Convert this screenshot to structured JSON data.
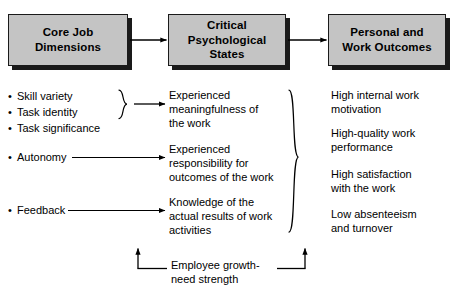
{
  "diagram": {
    "boxes": [
      {
        "id": "core-job-dimensions",
        "line1": "Core Job",
        "line2": "Dimensions"
      },
      {
        "id": "critical-psychological-states",
        "line1": "Critical",
        "line2": "Psychological",
        "line3": "States"
      },
      {
        "id": "personal-and-work-outcomes",
        "line1": "Personal and",
        "line2": "Work Outcomes"
      }
    ],
    "core_job_dimensions": {
      "group1": [
        "Skill variety",
        "Task identity",
        "Task significance"
      ],
      "group2": [
        "Autonomy"
      ],
      "group3": [
        "Feedback"
      ]
    },
    "critical_psychological_states": [
      "Experienced\nmeaningfulness of\nthe work",
      "Experienced\nresponsibility for\noutcomes of the work",
      "Knowledge of the\nactual results of work\nactivities"
    ],
    "personal_and_work_outcomes": [
      "High internal work\nmotivation",
      "High-quality work\nperformance",
      "High satisfaction\nwith the work",
      "Low absenteeism\nand turnover"
    ],
    "moderator": "Employee growth-\nneed strength",
    "colors": {
      "box_fill": "#c4c4c4",
      "box_border": "#1a1a1a",
      "shadow": "#1a1a1a",
      "text": "#000000",
      "background": "#ffffff"
    }
  }
}
